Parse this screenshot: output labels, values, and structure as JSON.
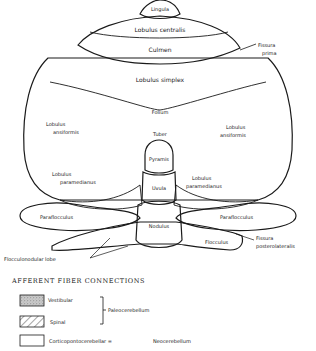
{
  "diagram": {
    "regions": {
      "lingula": "Lingula",
      "lobulus_centralis": "Lobulus centralis",
      "culmen": "Culmen",
      "fissura_prima_line1": "Fissura",
      "fissura_prima_line2": "prima",
      "lobulus_simplex": "Lobulus simplex",
      "folium": "Folium",
      "tuber": "Tuber",
      "ansiformis_left_line1": "Lobulus",
      "ansiformis_left_line2": "ansiformis",
      "ansiformis_right_line1": "Lobulus",
      "ansiformis_right_line2": "ansiformis",
      "pyramis": "Pyramis",
      "uvula": "Uvula",
      "paramedianus_left_line1": "Lobulus",
      "paramedianus_left_line2": "paramedianus",
      "paramedianus_right_line1": "Lobulus",
      "paramedianus_right_line2": "paramedianus",
      "paraflocculus_left": "Paraflocculus",
      "paraflocculus_right": "Paraflocculus",
      "nodulus": "Nodulus",
      "flocculus": "Flocculus",
      "flocculonodular_lobe": "Flocculonodular  lobe",
      "fissura_posterolateralis_line1": "Fissura",
      "fissura_posterolateralis_line2": "posterolateralis"
    }
  },
  "legend": {
    "heading": "AFFERENT  FIBER  CONNECTIONS",
    "items": [
      {
        "pattern": "stippled",
        "label": "Vestibular"
      },
      {
        "pattern": "hatched",
        "label": "Spinal"
      },
      {
        "pattern": "blank",
        "label": "Corticopontocerebellar ="
      }
    ],
    "bracket_label": "Paleocerebellum",
    "neo_label": "Neocerebellum"
  },
  "colors": {
    "ink": "#1a1a1a",
    "stipple": "#b8b8b8",
    "background": "#ffffff"
  }
}
